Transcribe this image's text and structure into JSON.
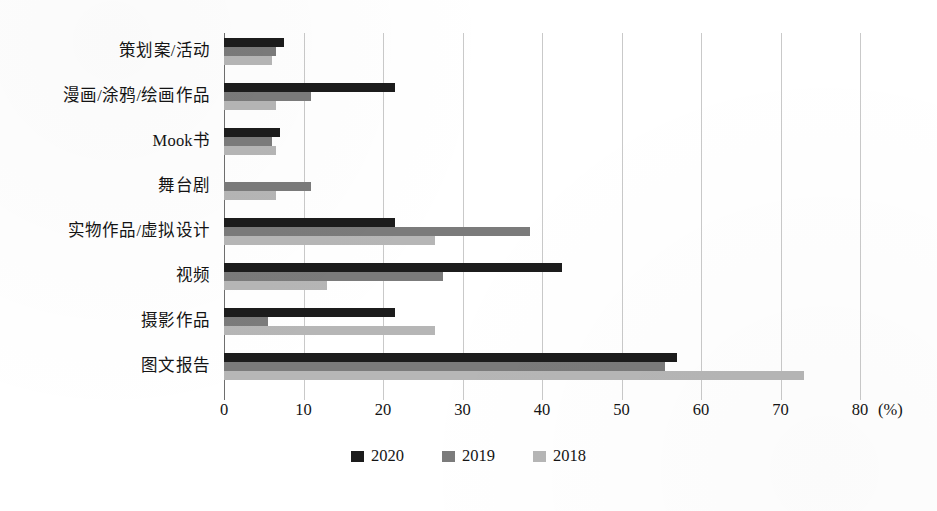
{
  "chart_data": {
    "type": "bar",
    "orientation": "horizontal",
    "title": "",
    "xlabel": "(%)",
    "ylabel": "",
    "xlim": [
      0,
      80
    ],
    "xticks": [
      0,
      10,
      20,
      30,
      40,
      50,
      60,
      70,
      80
    ],
    "xtick_labels": [
      "0",
      "10",
      "20",
      "30",
      "40",
      "50",
      "60",
      "70",
      "80"
    ],
    "axis_unit": "(%)",
    "grid": true,
    "grid_axis": "x",
    "legend_position": "bottom-center",
    "categories": [
      "策划案/活动",
      "漫画/涂鸦/绘画作品",
      "Mook书",
      "舞台剧",
      "实物作品/虚拟设计",
      "视频",
      "摄影作品",
      "图文报告"
    ],
    "series": [
      {
        "name": "2020",
        "color": "#1c1c1c",
        "values": [
          7.5,
          21.5,
          7.0,
          0.0,
          21.5,
          42.5,
          21.5,
          57.0
        ]
      },
      {
        "name": "2019",
        "color": "#7b7b7b",
        "values": [
          6.5,
          11.0,
          6.0,
          11.0,
          38.5,
          27.5,
          5.5,
          55.5
        ]
      },
      {
        "name": "2018",
        "color": "#b6b6b6",
        "values": [
          6.0,
          6.5,
          6.5,
          6.5,
          26.5,
          13.0,
          26.5,
          73.0
        ]
      }
    ]
  },
  "legend": {
    "items": [
      {
        "label": "2020",
        "color": "#1c1c1c",
        "key": "s2020"
      },
      {
        "label": "2019",
        "color": "#7b7b7b",
        "key": "s2019"
      },
      {
        "label": "2018",
        "color": "#b6b6b6",
        "key": "s2018"
      }
    ]
  },
  "colors": {
    "series_2020": "#1c1c1c",
    "series_2019": "#7b7b7b",
    "series_2018": "#b6b6b6",
    "gridline": "#c9c9c9",
    "axis": "#6e6e6e",
    "text": "#141414",
    "background": "#ffffff"
  }
}
